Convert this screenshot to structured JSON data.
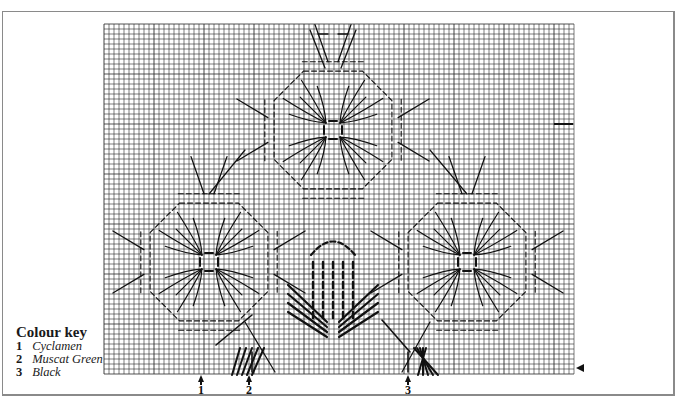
{
  "colour_key": {
    "title": "Colour key",
    "entries": [
      {
        "num": "1",
        "name": "Cyclamen"
      },
      {
        "num": "2",
        "name": "Muscat Green"
      },
      {
        "num": "3",
        "name": "Black"
      }
    ]
  },
  "column_markers": [
    {
      "label": "1",
      "x": 201
    },
    {
      "label": "2",
      "x": 249
    },
    {
      "label": "3",
      "x": 408
    }
  ],
  "row_marker": {
    "y": 369,
    "x": 576
  },
  "grid": {
    "x0": 104,
    "y0": 24,
    "x1": 574,
    "y1": 374,
    "cell": 5,
    "line_color": "#2a2a2a",
    "bold_every": 10
  },
  "motifs": [
    {
      "name": "top-flower",
      "cx": 333,
      "cy": 130
    },
    {
      "name": "left-flower",
      "cx": 209,
      "cy": 262
    },
    {
      "name": "right-flower",
      "cx": 467,
      "cy": 262
    }
  ],
  "colors": {
    "ink": "#111111",
    "frame": "#8a8a8a",
    "background": "#ffffff"
  }
}
